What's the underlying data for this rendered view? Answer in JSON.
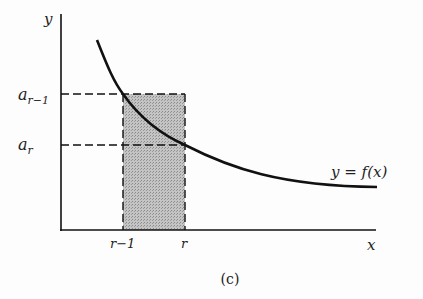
{
  "figure": {
    "caption": "(c)",
    "axis": {
      "x_label": "x",
      "y_label": "y"
    },
    "curve_label": "y = f(x)",
    "y_ticks": [
      {
        "label_base": "a",
        "label_sub": "r−1"
      },
      {
        "label_base": "a",
        "label_sub": "r"
      }
    ],
    "x_ticks": [
      {
        "label": "r−1"
      },
      {
        "label": "r"
      }
    ],
    "colors": {
      "ink": "#111111",
      "shade": "#b8b8b8",
      "background": "#fdfdfd"
    }
  }
}
